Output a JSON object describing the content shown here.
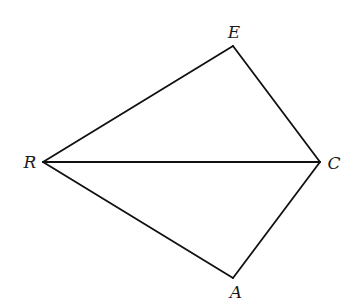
{
  "diagram": {
    "vertices": [
      {
        "id": "E",
        "label": "E",
        "x": 233,
        "y": 46,
        "label_x": 234,
        "label_y": 38
      },
      {
        "id": "R",
        "label": "R",
        "x": 43,
        "y": 162,
        "label_x": 30,
        "label_y": 168
      },
      {
        "id": "C",
        "label": "C",
        "x": 320,
        "y": 162,
        "label_x": 334,
        "label_y": 169
      },
      {
        "id": "A",
        "label": "A",
        "x": 233,
        "y": 278,
        "label_x": 236,
        "label_y": 298
      }
    ],
    "edges": [
      {
        "from": "R",
        "to": "E"
      },
      {
        "from": "E",
        "to": "C"
      },
      {
        "from": "R",
        "to": "C"
      },
      {
        "from": "R",
        "to": "A"
      },
      {
        "from": "A",
        "to": "C"
      }
    ],
    "labels": {
      "E": "E",
      "R": "R",
      "C": "C",
      "A": "A"
    },
    "colors": {
      "line": "#111111",
      "text": "#1a1a1a",
      "background": "#ffffff"
    }
  }
}
